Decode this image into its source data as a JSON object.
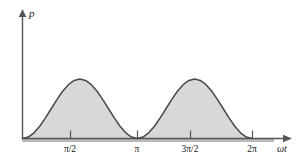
{
  "figure": {
    "title": "",
    "y_axis_label": "p",
    "x_axis_label": "ωt"
  },
  "ticks": [
    {
      "label": "π/2",
      "x_px": 70
    },
    {
      "label": "π",
      "x_px": 137
    },
    {
      "label": "3π/2",
      "x_px": 190
    },
    {
      "label": "2π",
      "x_px": 252
    }
  ],
  "colors": {
    "fill": "#d8d8d8",
    "curve": "#4a4a4a",
    "axis": "#555555",
    "baseline_band": "#b9b9b9",
    "text": "#1a1a1a"
  },
  "chart_data": {
    "type": "area",
    "title": "",
    "xlabel": "ωt",
    "ylabel": "p",
    "xlim": [
      0,
      6.6
    ],
    "ylim": [
      0,
      1.15
    ],
    "grid": false,
    "legend": null,
    "xtick_labels": [
      "π/2",
      "π",
      "3π/2",
      "2π"
    ],
    "xtick_values": [
      1.5708,
      3.1416,
      4.7124,
      6.2832
    ],
    "ytick_labels": [],
    "annotations": [],
    "series": [
      {
        "name": "p",
        "formula": "p = sin^2(wt)",
        "x": [
          0.0,
          0.1571,
          0.3142,
          0.4712,
          0.6283,
          0.7854,
          0.9425,
          1.0996,
          1.2566,
          1.4137,
          1.5708,
          1.7279,
          1.885,
          2.042,
          2.1991,
          2.3562,
          2.5133,
          2.6704,
          2.8274,
          2.9845,
          3.1416,
          3.2987,
          3.4558,
          3.6128,
          3.7699,
          3.927,
          4.0841,
          4.2412,
          4.3982,
          4.5553,
          4.7124,
          4.8695,
          5.0265,
          5.1836,
          5.3407,
          5.4978,
          5.6549,
          5.8119,
          5.969,
          6.1261,
          6.2832
        ],
        "y": [
          0.0,
          0.0245,
          0.0955,
          0.2061,
          0.3455,
          0.5,
          0.6545,
          0.7939,
          0.9045,
          0.9755,
          1.0,
          0.9755,
          0.9045,
          0.7939,
          0.6545,
          0.5,
          0.3455,
          0.2061,
          0.0955,
          0.0245,
          0.0,
          0.0245,
          0.0955,
          0.2061,
          0.3455,
          0.5,
          0.6545,
          0.7939,
          0.9045,
          0.9755,
          1.0,
          0.9755,
          0.9045,
          0.7939,
          0.6545,
          0.5,
          0.3455,
          0.2061,
          0.0955,
          0.0245,
          0.0
        ]
      }
    ]
  }
}
